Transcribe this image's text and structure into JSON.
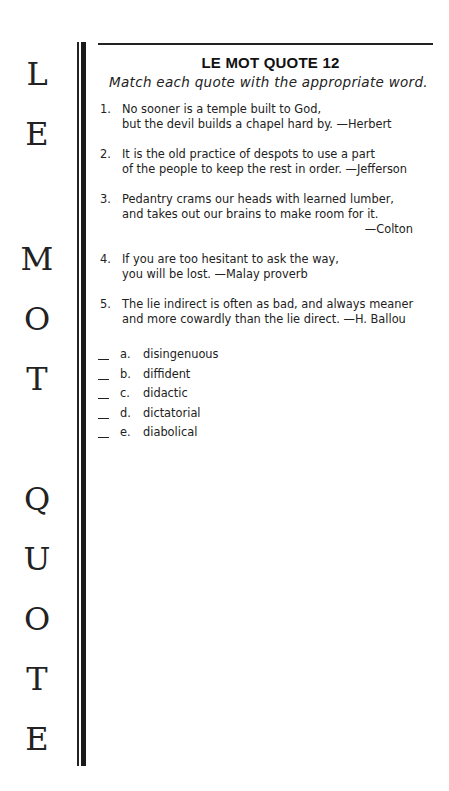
{
  "side_banner": {
    "letters": [
      {
        "char": "L",
        "top": 58
      },
      {
        "char": "E",
        "top": 118
      },
      {
        "char": "M",
        "top": 243
      },
      {
        "char": "O",
        "top": 303
      },
      {
        "char": "T",
        "top": 363
      },
      {
        "char": "Q",
        "top": 483
      },
      {
        "char": "U",
        "top": 543
      },
      {
        "char": "O",
        "top": 603
      },
      {
        "char": "T",
        "top": 663
      },
      {
        "char": "E",
        "top": 723
      }
    ]
  },
  "header": {
    "title": "LE MOT QUOTE 12",
    "instructions": "Match each quote with the appropriate word."
  },
  "quotes": [
    {
      "number": "1.",
      "lines": [
        "No sooner is a temple built to God,",
        "but the devil builds a chapel hard by. —Herbert"
      ],
      "attribution_right": ""
    },
    {
      "number": "2.",
      "lines": [
        "It is the old practice of despots to use a part",
        "of the people to keep the rest in order. —Jefferson"
      ],
      "attribution_right": ""
    },
    {
      "number": "3.",
      "lines": [
        "Pedantry crams our heads with learned lumber,",
        "and takes out our brains to make room for it."
      ],
      "attribution_right": "—Colton"
    },
    {
      "number": "4.",
      "lines": [
        "If you are too hesitant to ask the way,",
        "you will be lost.  —Malay proverb"
      ],
      "attribution_right": ""
    },
    {
      "number": "5.",
      "lines": [
        "The lie indirect is often as bad, and always meaner",
        "and more cowardly than the lie direct. —H. Ballou"
      ],
      "attribution_right": ""
    }
  ],
  "options": [
    {
      "letter": "a.",
      "word": "disingenuous"
    },
    {
      "letter": "b.",
      "word": "diffident"
    },
    {
      "letter": "c.",
      "word": "didactic"
    },
    {
      "letter": "d.",
      "word": "dictatorial"
    },
    {
      "letter": "e.",
      "word": "diabolical"
    }
  ]
}
